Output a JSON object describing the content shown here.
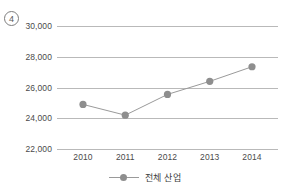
{
  "figure": {
    "index_marker": "4"
  },
  "chart_data": {
    "type": "line",
    "title": "",
    "xlabel": "",
    "ylabel": "",
    "categories": [
      "2010",
      "2011",
      "2012",
      "2013",
      "2014"
    ],
    "series": [
      {
        "name": "전체 산업",
        "values": [
          24900,
          24200,
          25550,
          26400,
          27350
        ],
        "color": "#9a9a9a",
        "marker": "circle"
      }
    ],
    "ylim": [
      22000,
      30000
    ],
    "yticks": [
      30000,
      28000,
      26000,
      24000,
      22000
    ],
    "ytick_labels": [
      "30,000",
      "28,000",
      "26,000",
      "24,000",
      "22,000"
    ],
    "xtick_labels": [
      "2010",
      "2011",
      "2012",
      "2013",
      "2014"
    ],
    "grid": true,
    "grid_color": "#b9b9b9",
    "legend": {
      "position": "bottom-center",
      "entries": [
        "전체 산업"
      ]
    }
  }
}
